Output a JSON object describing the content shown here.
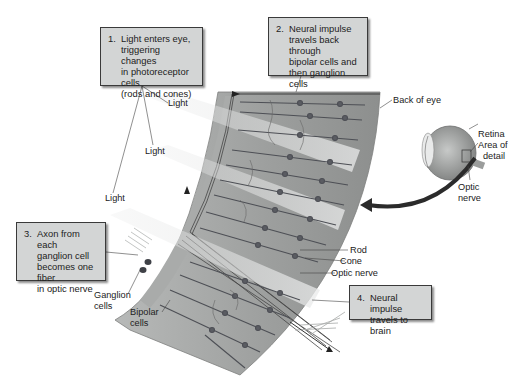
{
  "callouts": [
    {
      "num": "1.",
      "lines": [
        "Light enters eye,",
        "triggering changes",
        "in photoreceptor cells",
        "(rods and cones)"
      ]
    },
    {
      "num": "2.",
      "lines": [
        "Neural impulse",
        "travels back through",
        "bipolar cells and",
        "then ganglion cells"
      ]
    },
    {
      "num": "3.",
      "lines": [
        "Axon from each",
        "ganglion cell",
        "becomes one fiber",
        "in optic nerve"
      ]
    },
    {
      "num": "4.",
      "lines": [
        "Neural impulse",
        "travels to brain"
      ]
    }
  ],
  "labels": {
    "light_1": "Light",
    "light_2": "Light",
    "light_3": "Light",
    "back_of_eye": "Back of eye",
    "retina": "Retina",
    "area_of_detail_1": "Area of",
    "area_of_detail_2": "detail",
    "optic_nerve_eye_1": "Optic",
    "optic_nerve_eye_2": "nerve",
    "rod": "Rod",
    "cone": "Cone",
    "optic_nerve": "Optic nerve",
    "ganglion_1": "Ganglion",
    "ganglion_2": "cells",
    "bipolar_1": "Bipolar",
    "bipolar_2": "cells"
  },
  "colors": {
    "callout_bg": "#d3d5d5",
    "retina_tissue": "#9a9c9b",
    "retina_light": "#c4c6c5",
    "cell_dark": "#4d4f55",
    "arrow_dark": "#2b2b2b"
  }
}
